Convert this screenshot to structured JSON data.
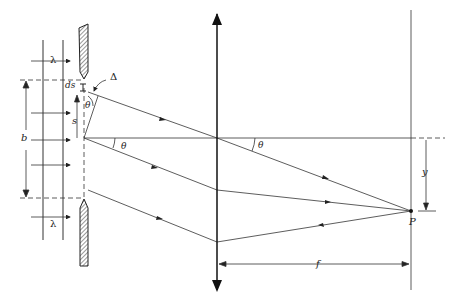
{
  "diagram": {
    "colors": {
      "line": "#333333",
      "hatch": "#333333",
      "background": "#ffffff"
    },
    "labels": {
      "wavelength_top": "λ",
      "wavelength_bottom": "λ",
      "ds": "ds",
      "delta": "Δ",
      "s": "s",
      "b": "b",
      "theta_slit_small": "θ",
      "theta_slit": "θ",
      "theta_lens": "θ",
      "y": "y",
      "P": "P",
      "f": "f"
    },
    "components": [
      "incident-wavefront-lines",
      "slit-upper-jaw",
      "slit-lower-jaw",
      "converging-lens",
      "screen",
      "optical-axis",
      "rays-to-point-P"
    ]
  }
}
